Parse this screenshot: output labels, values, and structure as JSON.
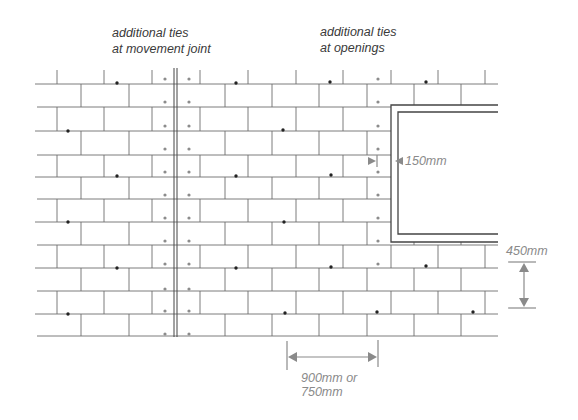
{
  "diagram": {
    "type": "brickwork wall tie spacing elevation",
    "colors": {
      "mortar_lines": "#6e6e6e",
      "tie_standard": "#222222",
      "tie_additional": "#8c8c8c",
      "dimension": "#8a8a8a",
      "label": "#3a3a3a"
    },
    "labels": {
      "movement_joint_line1": "additional ties",
      "movement_joint_line2": "at movement joint",
      "openings_line1": "additional ties",
      "openings_line2": "at openings"
    },
    "dimensions": {
      "opening_offset": "150mm",
      "vertical_spacing": "450mm",
      "horizontal_spacing_line1": "900mm or",
      "horizontal_spacing_line2": "750mm"
    },
    "geometry": {
      "wall_left": 35,
      "wall_right": 498,
      "bed_joints_y": [
        84,
        107,
        131,
        155,
        177,
        199,
        222,
        245,
        268,
        291,
        314,
        336
      ],
      "top_ticks_y": 70,
      "row_a_perps_x": [
        57,
        104,
        152,
        200,
        248,
        296,
        343,
        391,
        438,
        485
      ],
      "row_b_perps_x": [
        81,
        129,
        225,
        272,
        319,
        367,
        414,
        461
      ],
      "movement_joint_x": [
        174,
        177
      ],
      "opening_outer": {
        "x": 391,
        "y": 105,
        "right": 498,
        "bottom": 242
      },
      "opening_inner": {
        "x": 398,
        "y": 112,
        "right": 498,
        "bottom": 234
      },
      "standard_ties": [
        [
          117,
          83
        ],
        [
          236,
          83
        ],
        [
          330,
          82
        ],
        [
          426,
          82
        ],
        [
          68,
          131
        ],
        [
          283,
          130
        ],
        [
          117,
          176
        ],
        [
          236,
          176
        ],
        [
          331,
          175
        ],
        [
          68,
          222
        ],
        [
          284,
          222
        ],
        [
          117,
          268
        ],
        [
          236,
          268
        ],
        [
          331,
          267
        ],
        [
          426,
          266
        ],
        [
          68,
          314
        ],
        [
          285,
          313
        ],
        [
          377,
          312
        ],
        [
          473,
          312
        ]
      ],
      "joint_tie_rows_y": [
        79,
        102,
        126,
        149,
        172,
        195,
        218,
        241,
        264,
        289,
        311,
        334
      ],
      "joint_tie_x": [
        165,
        189
      ],
      "opening_tie_x": 378,
      "opening_tie_rows_y": [
        79,
        102,
        126,
        149,
        172,
        195,
        218,
        241,
        264
      ]
    }
  }
}
